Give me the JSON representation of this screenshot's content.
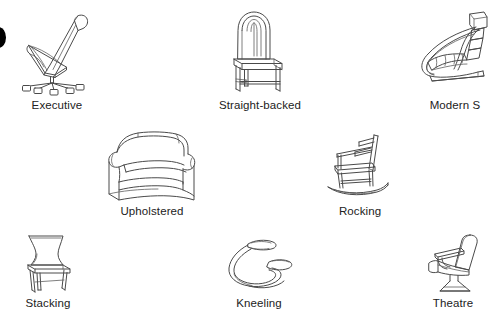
{
  "figure": {
    "background_color": "#ffffff",
    "line_color": "#4a4a4a",
    "label_color": "#222222",
    "bullet_color": "#000000",
    "bullet_name": "partial-black-circle-bullet",
    "rows": 3,
    "item_count": 8
  },
  "items": [
    {
      "id": "executive",
      "label": "Executive",
      "row": 1,
      "col": 1,
      "icon": "executive-office-chair-illustration"
    },
    {
      "id": "straight-backed",
      "label": "Straight-backed",
      "row": 1,
      "col": 2,
      "icon": "straight-backed-chair-illustration"
    },
    {
      "id": "modern-s",
      "label": "Modern S",
      "row": 1,
      "col": 3,
      "icon": "modern-s-cantilever-chair-illustration"
    },
    {
      "id": "upholstered",
      "label": "Upholstered",
      "row": 2,
      "col": 1,
      "icon": "upholstered-armchair-illustration"
    },
    {
      "id": "rocking",
      "label": "Rocking",
      "row": 2,
      "col": 2,
      "icon": "rocking-chair-illustration"
    },
    {
      "id": "stacking",
      "label": "Stacking",
      "row": 3,
      "col": 1,
      "icon": "stacking-chair-illustration"
    },
    {
      "id": "kneeling",
      "label": "Kneeling",
      "row": 3,
      "col": 2,
      "icon": "kneeling-chair-illustration"
    },
    {
      "id": "theatre",
      "label": "Theatre",
      "row": 3,
      "col": 3,
      "icon": "theatre-seat-illustration"
    }
  ]
}
